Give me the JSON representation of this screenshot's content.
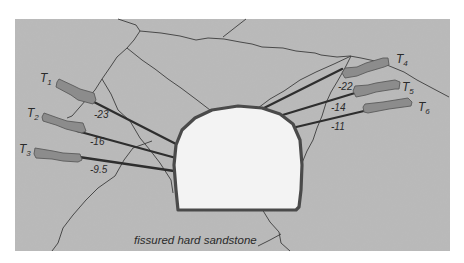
{
  "diagram": {
    "caption": "fissured  hard sandstone",
    "colors": {
      "rock": "#b9b9b9",
      "tunnel_fill": "#f3f3f3",
      "tunnel_outline": "#4a4a4a",
      "tendon": "#2e2e2e",
      "anchor_fill": "#8c8c8c",
      "crack": "#3c3c3c"
    },
    "tendons": [
      {
        "id": "T1",
        "letter": "T",
        "sub": "1",
        "value": "-23"
      },
      {
        "id": "T2",
        "letter": "T",
        "sub": "2",
        "value": "-16"
      },
      {
        "id": "T3",
        "letter": "T",
        "sub": "3",
        "value": "-9.5"
      },
      {
        "id": "T4",
        "letter": "T",
        "sub": "4",
        "value": "-22"
      },
      {
        "id": "T5",
        "letter": "T",
        "sub": "5",
        "value": "-14"
      },
      {
        "id": "T6",
        "letter": "T",
        "sub": "6",
        "value": "-11"
      }
    ]
  }
}
